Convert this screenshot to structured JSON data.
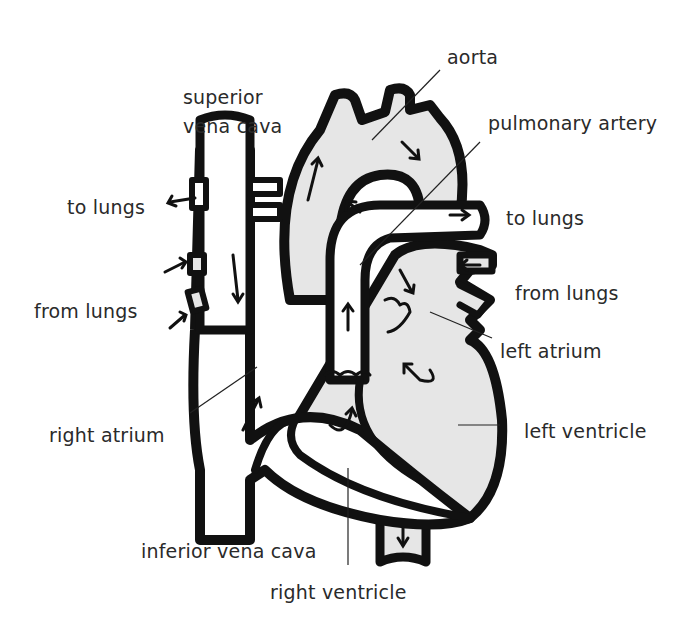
{
  "diagram": {
    "title": "",
    "colors": {
      "outline": "#111111",
      "fill": "#e6e6e6",
      "background": "#ffffff",
      "text": "#2a2a2a"
    },
    "labels": {
      "aorta": "aorta",
      "superior_vena_cava_1": "superior",
      "superior_vena_cava_2": "vena cava",
      "pulmonary_artery": "pulmonary artery",
      "to_lungs_left": "to lungs",
      "to_lungs_right": "to lungs",
      "from_lungs_left": "from lungs",
      "from_lungs_right": "from lungs",
      "left_atrium": "left atrium",
      "right_atrium": "right atrium",
      "left_ventricle": "left ventricle",
      "inferior_vena_cava": "inferior vena cava",
      "right_ventricle": "right ventricle"
    }
  }
}
